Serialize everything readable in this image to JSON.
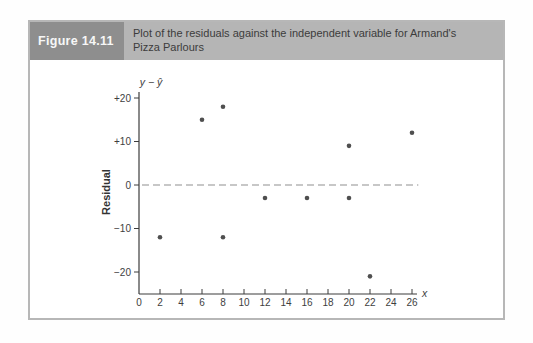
{
  "figure": {
    "label": "Figure 14.11",
    "caption": "Plot of the residuals against the independent variable for Armand's Pizza Parlours"
  },
  "colors": {
    "header_tab_bg": "#8e8e8e",
    "header_bg": "#b5b5b5",
    "box_border": "#b7b7b7"
  },
  "chart_data": {
    "type": "scatter",
    "title": "",
    "xlabel": "x",
    "ylabel": "Residual",
    "y_axis_title": "y − ŷ",
    "xlim": [
      0,
      27
    ],
    "ylim": [
      -24,
      22
    ],
    "grid": false,
    "legend": "none",
    "x_ticks": [
      0,
      2,
      4,
      6,
      8,
      10,
      12,
      14,
      16,
      18,
      20,
      22,
      24,
      26
    ],
    "y_ticks": [
      20,
      10,
      0,
      -10,
      -20
    ],
    "y_tick_labels": [
      "+20",
      "+10",
      "0",
      "−10",
      "−20"
    ],
    "zero_line": {
      "y": 0,
      "style": "dashed",
      "color": "#8f8f8f"
    },
    "points": [
      {
        "x": 2,
        "y": -12
      },
      {
        "x": 6,
        "y": 15
      },
      {
        "x": 8,
        "y": 18
      },
      {
        "x": 8,
        "y": -12
      },
      {
        "x": 12,
        "y": -3
      },
      {
        "x": 16,
        "y": -3
      },
      {
        "x": 20,
        "y": -3
      },
      {
        "x": 20,
        "y": 9
      },
      {
        "x": 22,
        "y": -21
      },
      {
        "x": 26,
        "y": 12
      }
    ],
    "point_color": "#4f4f4f",
    "axis_color": "#3c3c3c",
    "text_color": "#3e3e3e"
  }
}
